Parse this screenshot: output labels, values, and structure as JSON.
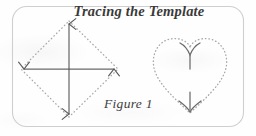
{
  "figure": {
    "title": "Tracing the Template",
    "caption": "Figure 1",
    "frame": {
      "shape": "rounded-rectangle",
      "stroke_color": "#cfcfcf",
      "x": 12,
      "y": 6,
      "width": 232,
      "height": 121,
      "corner_radius": 14
    },
    "background_color": "#fefefe",
    "ink_color": "#5a5a5a",
    "dot_color": "#a8a8a8",
    "shapes": [
      {
        "name": "diamond-template",
        "type": "diamond",
        "outline_style": "dotted",
        "vertices": [
          {
            "label": "top",
            "x": 69,
            "y": 21
          },
          {
            "label": "right",
            "x": 118,
            "y": 69
          },
          {
            "label": "bottom",
            "x": 69,
            "y": 117
          },
          {
            "label": "left",
            "x": 21,
            "y": 69
          }
        ],
        "center": {
          "x": 69,
          "y": 69
        },
        "arrows": [
          {
            "name": "arrow-up",
            "direction": "up",
            "from": {
              "x": 69,
              "y": 69
            },
            "to": {
              "x": 69,
              "y": 23
            }
          },
          {
            "name": "arrow-right",
            "direction": "right",
            "from": {
              "x": 69,
              "y": 69
            },
            "to": {
              "x": 116,
              "y": 69
            }
          },
          {
            "name": "arrow-down",
            "direction": "down",
            "from": {
              "x": 69,
              "y": 69
            },
            "to": {
              "x": 69,
              "y": 115
            }
          },
          {
            "name": "arrow-left",
            "direction": "left",
            "from": {
              "x": 69,
              "y": 69
            },
            "to": {
              "x": 23,
              "y": 69
            }
          }
        ]
      },
      {
        "name": "heart-template",
        "type": "heart",
        "outline_style": "dotted",
        "bounds": {
          "x": 152,
          "y": 40,
          "width": 76,
          "height": 75
        },
        "cleft": {
          "x": 190,
          "y": 46
        },
        "point": {
          "x": 190,
          "y": 114
        },
        "arrows": [
          {
            "name": "arrow-up-cleft",
            "direction": "up",
            "from": {
              "x": 190,
              "y": 68
            },
            "to": {
              "x": 190,
              "y": 47
            }
          },
          {
            "name": "arrow-down-point",
            "direction": "down",
            "from": {
              "x": 190,
              "y": 92
            },
            "to": {
              "x": 190,
              "y": 113
            }
          }
        ]
      }
    ]
  }
}
